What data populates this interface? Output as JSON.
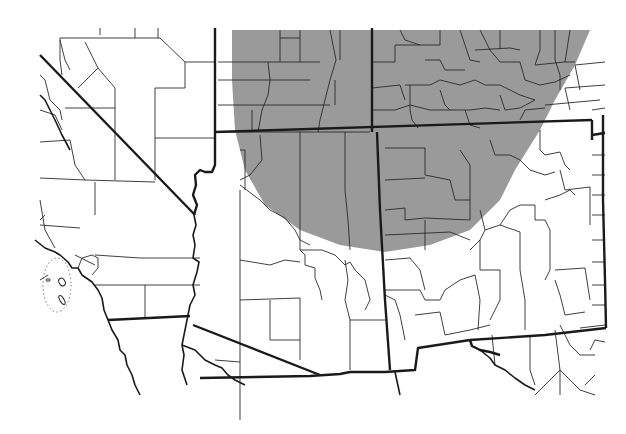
{
  "map": {
    "title": "",
    "type": "range-map",
    "region": "Southwestern United States (Four Corners region)",
    "colors": {
      "background": "#ffffff",
      "range_fill": "#9a9a9a",
      "borders": "#1a1a1a"
    },
    "legend": [],
    "labels": [],
    "layers": [
      {
        "name": "shaded-range",
        "description": "Gray shaded distribution area covering northern Arizona/New Mexico and southern Utah/Colorado"
      },
      {
        "name": "state-boundaries",
        "description": "Thick state border lines"
      },
      {
        "name": "county-boundaries",
        "description": "Thin county border lines"
      },
      {
        "name": "coastline",
        "description": "Pacific coast with Channel Islands enclosed by dotted line"
      }
    ]
  }
}
